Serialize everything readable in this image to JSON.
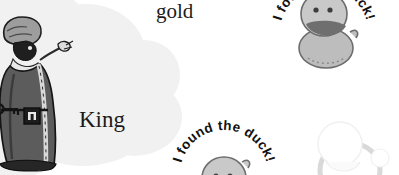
{
  "canvas": {
    "width": 399,
    "height": 175,
    "background": "#ffffff"
  },
  "scene": {
    "description": "Scanned storybook page fragment with a king illustration and duck stamps",
    "blob": {
      "name": "grey-cloud-highlight",
      "color": "#f1f1f1"
    }
  },
  "labels": {
    "gold": "gold",
    "king": "King"
  },
  "king": {
    "name": "king-illustration",
    "robe_color": "#5b5b5b",
    "robe_shadow": "#3c3c3c",
    "crown_color": "#9a9a9a",
    "outline_color": "#1a1a1a",
    "accessories": [
      "key",
      "lock"
    ]
  },
  "stamps": [
    {
      "id": "duck-top",
      "text": "I found the duck!",
      "body_color": "#b9b9b9",
      "head_color": "#c6c6c6",
      "beak_color": "#6f6f6f",
      "outline_color": "#6a6a6a",
      "text_color": "#111111",
      "clipped": true
    },
    {
      "id": "duck-bottom",
      "text": "I found the duck!",
      "body_color": "#b9b9b9",
      "head_color": "#c6c6c6",
      "beak_color": "#6f6f6f",
      "outline_color": "#6a6a6a",
      "text_color": "#111111",
      "clipped": true
    },
    {
      "id": "duck-ghost",
      "text": "",
      "body_color": "#fbfbfb",
      "head_color": "#ffffff",
      "beak_color": "#f4f4f4",
      "outline_color": "#e6e6e6",
      "text_color": "#f2f2f2",
      "clipped": true
    }
  ]
}
